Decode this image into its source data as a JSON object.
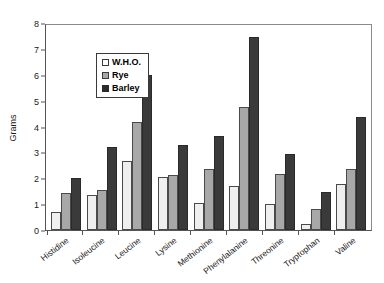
{
  "chart_data": {
    "type": "bar",
    "title": "",
    "xlabel": "",
    "ylabel": "Grams",
    "ylim": [
      0,
      8
    ],
    "yticks": [
      0,
      1,
      2,
      3,
      4,
      5,
      6,
      7,
      8
    ],
    "grid": false,
    "legend_position": "top-left",
    "categories": [
      "Histidine",
      "Isoleucine",
      "Leucine",
      "Lysine",
      "Methionine",
      "Phenylalanine",
      "Threonine",
      "Tryptophan",
      "Valine"
    ],
    "series": [
      {
        "name": "W.H.O.",
        "color": "#efefef",
        "values": [
          0.7,
          1.35,
          2.65,
          2.05,
          1.05,
          1.7,
          1.02,
          0.25,
          1.78
        ]
      },
      {
        "name": "Rye",
        "color": "#a8a8a8",
        "values": [
          1.42,
          1.55,
          4.18,
          2.12,
          2.35,
          4.75,
          2.15,
          0.8,
          2.35
        ]
      },
      {
        "name": "Barley",
        "color": "#3a3a3a",
        "values": [
          2.0,
          3.22,
          6.0,
          3.3,
          3.65,
          7.45,
          2.95,
          1.45,
          4.35
        ]
      }
    ]
  }
}
